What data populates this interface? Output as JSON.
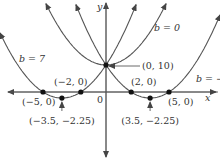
{
  "chart_data": {
    "type": "line",
    "title": "",
    "xlabel": "x",
    "ylabel": "y",
    "origin_label": "0",
    "function": "y = x^2 + b x + 10",
    "xlim": [
      -8.4,
      8.9
    ],
    "ylim": [
      -24,
      34
    ],
    "series": [
      {
        "name": "b = 7",
        "b": 7,
        "label": "b = 7"
      },
      {
        "name": "b = 0",
        "b": 0,
        "label": "b = 0"
      },
      {
        "name": "b = -7",
        "b": -7,
        "label": "b = −7"
      }
    ],
    "points": [
      {
        "x": 0,
        "y": 10,
        "label": "(0, 10)"
      },
      {
        "x": -5,
        "y": 0,
        "label": "(−5, 0)"
      },
      {
        "x": -2,
        "y": 0,
        "label": "(−2, 0)"
      },
      {
        "x": 2,
        "y": 0,
        "label": "(2, 0)"
      },
      {
        "x": 5,
        "y": 0,
        "label": "(5, 0)"
      },
      {
        "x": -3.5,
        "y": -2.25,
        "label": "(−3.5, −2.25)"
      },
      {
        "x": 3.5,
        "y": -2.25,
        "label": "(3.5, −2.25)"
      }
    ],
    "colors": {
      "curve": "#555555",
      "axis": "#555555",
      "point": "#111111"
    }
  }
}
